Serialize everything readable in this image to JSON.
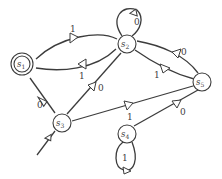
{
  "diagram": {
    "type": "finite-automaton",
    "colors": {
      "stroke": "#3c3c3c",
      "background": "#ffffff"
    },
    "states": [
      {
        "id": "s1",
        "label": "s",
        "sub": "1",
        "accepting": true,
        "start": false
      },
      {
        "id": "s2",
        "label": "s",
        "sub": "2",
        "accepting": false,
        "start": false
      },
      {
        "id": "s3",
        "label": "s",
        "sub": "3",
        "accepting": false,
        "start": true
      },
      {
        "id": "s4",
        "label": "s",
        "sub": "4",
        "accepting": false,
        "start": false
      },
      {
        "id": "s5",
        "label": "s",
        "sub": "5",
        "accepting": false,
        "start": false
      }
    ],
    "transitions": [
      {
        "from": "s1",
        "to": "s2",
        "label": "1"
      },
      {
        "from": "s2",
        "to": "s1",
        "label": "1"
      },
      {
        "from": "s1",
        "to": "s3",
        "label": "0"
      },
      {
        "from": "s3",
        "to": "s2",
        "label": "0"
      },
      {
        "from": "s3",
        "to": "s5",
        "label": "1"
      },
      {
        "from": "s2",
        "to": "s2",
        "label": "0"
      },
      {
        "from": "s2",
        "to": "s5",
        "label": "1"
      },
      {
        "from": "s5",
        "to": "s2",
        "label": "0"
      },
      {
        "from": "s4",
        "to": "s5",
        "label": "0"
      },
      {
        "from": "s4",
        "to": "s4",
        "label": "1"
      }
    ]
  }
}
